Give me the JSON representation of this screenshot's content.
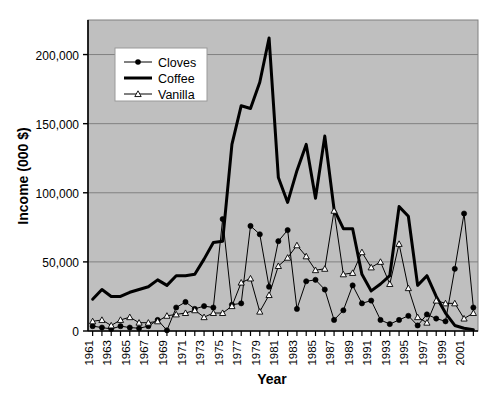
{
  "chart_data": {
    "type": "line",
    "title": "",
    "xlabel": "Year",
    "ylabel": "Income (000 $)",
    "x": [
      1961,
      1962,
      1963,
      1964,
      1965,
      1966,
      1967,
      1968,
      1969,
      1970,
      1971,
      1972,
      1973,
      1974,
      1975,
      1976,
      1977,
      1978,
      1979,
      1980,
      1981,
      1982,
      1983,
      1984,
      1985,
      1986,
      1987,
      1988,
      1989,
      1990,
      1991,
      1992,
      1993,
      1994,
      1995,
      1996,
      1997,
      1998,
      1999,
      2000,
      2001,
      2002
    ],
    "xlim": [
      1960.5,
      2002.5
    ],
    "ylim": [
      0,
      225000
    ],
    "yticks": [
      0,
      50000,
      100000,
      150000,
      200000
    ],
    "ytick_labels": [
      "0",
      "50,000",
      "100,000",
      "150,000",
      "200,000"
    ],
    "xtick_labels": [
      "1961",
      "1963",
      "1965",
      "1967",
      "1969",
      "1971",
      "1973",
      "1975",
      "1977",
      "1979",
      "1981",
      "1983",
      "1985",
      "1987",
      "1989",
      "1991",
      "1993",
      "1995",
      "1997",
      "1999",
      "2001"
    ],
    "grid": true,
    "grid_axis": "y",
    "plot_background": "#bfbfbf",
    "legend_position": "upper-left-inside",
    "series": [
      {
        "name": "Cloves",
        "marker": "filled-diamond",
        "color": "#000000",
        "line_width": 1,
        "values": [
          3500,
          2500,
          1500,
          3500,
          2500,
          2000,
          3500,
          8000,
          500,
          17000,
          21000,
          16000,
          18000,
          17000,
          81000,
          19000,
          20000,
          76000,
          70000,
          32000,
          65000,
          73000,
          16000,
          36000,
          37000,
          30000,
          8000,
          15000,
          33000,
          20000,
          22000,
          8000,
          5000,
          8000,
          11000,
          4000,
          12000,
          9000,
          7000,
          45000,
          85000,
          17000
        ]
      },
      {
        "name": "Coffee",
        "marker": "none",
        "color": "#000000",
        "line_width": 3,
        "values": [
          23000,
          30000,
          25000,
          25000,
          28000,
          30000,
          32000,
          37000,
          33000,
          40000,
          40000,
          41000,
          52000,
          64000,
          65000,
          135000,
          163000,
          161000,
          180000,
          212000,
          111000,
          93000,
          116000,
          135000,
          96000,
          141000,
          88000,
          74000,
          74000,
          41000,
          29000,
          34000,
          40000,
          90000,
          83000,
          33000,
          40000,
          25000,
          13000,
          4000,
          2000,
          1000
        ]
      },
      {
        "name": "Vanilla",
        "marker": "open-triangle",
        "color": "#000000",
        "line_width": 1,
        "values": [
          7000,
          8000,
          4000,
          8000,
          10000,
          6000,
          6000,
          7000,
          11000,
          12000,
          13000,
          15000,
          10000,
          13000,
          13000,
          18000,
          35000,
          38000,
          14000,
          26000,
          47000,
          53000,
          62000,
          54000,
          44000,
          45000,
          87000,
          41000,
          42000,
          57000,
          46000,
          50000,
          34000,
          63000,
          31000,
          10000,
          6000,
          22000,
          20000,
          20000,
          9000,
          13000
        ]
      }
    ]
  },
  "axes": {
    "ylabel": "Income (000 $)",
    "xlabel": "Year"
  },
  "legend": {
    "items": [
      {
        "label": "Cloves",
        "marker": "filled-diamond"
      },
      {
        "label": "Coffee",
        "marker": "none"
      },
      {
        "label": "Vanilla",
        "marker": "open-triangle"
      }
    ]
  }
}
